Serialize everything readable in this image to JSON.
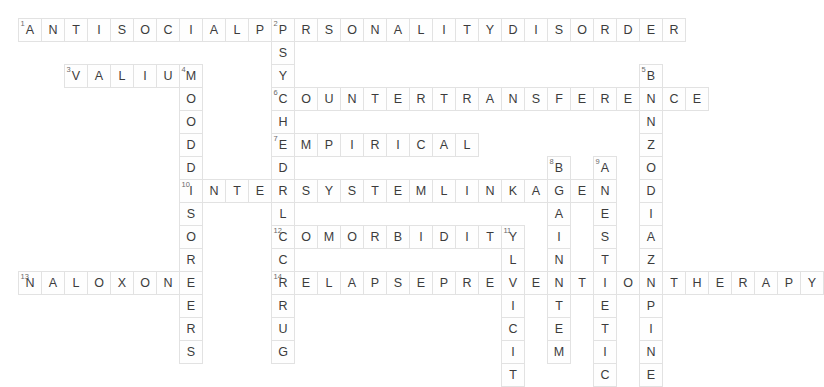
{
  "puzzle": {
    "title": "Psychiatry Crossword Grid",
    "grid": {
      "origin_x": 18,
      "origin_y": 18,
      "cell_size": 23,
      "cols": 29,
      "rows": 14
    },
    "colors": {
      "cell_fill": "#fefefe",
      "cell_border": "#e2e2e2",
      "letter": "#3c3c3c",
      "clue_number": "#6a6a6a",
      "background": "#ffffff"
    },
    "entries": [
      {
        "number": "1",
        "direction": "across",
        "answer": "ANTISOCIALPERSONALITYDISORDER",
        "row": 0,
        "col": 0
      },
      {
        "number": "2",
        "direction": "down",
        "answer": "PSYCHEDELICDRUG",
        "row": 0,
        "col": 11
      },
      {
        "number": "3",
        "direction": "across",
        "answer": "VALIUM",
        "row": 2,
        "col": 2
      },
      {
        "number": "4",
        "direction": "down",
        "answer": "MOODDISORDERS",
        "row": 2,
        "col": 7
      },
      {
        "number": "5",
        "direction": "down",
        "answer": "BENZODIAZEPINE",
        "row": 2,
        "col": 27
      },
      {
        "number": "6",
        "direction": "across",
        "answer": "COUNTERTRANSFERENCE",
        "row": 3,
        "col": 11
      },
      {
        "number": "7",
        "direction": "across",
        "answer": "EMPIRICAL",
        "row": 5,
        "col": 11
      },
      {
        "number": "8",
        "direction": "down",
        "answer": "BRAINSTEM",
        "row": 6,
        "col": 23
      },
      {
        "number": "9",
        "direction": "down",
        "answer": "ANESTHETIC",
        "row": 6,
        "col": 25
      },
      {
        "number": "10",
        "direction": "across",
        "answer": "INTERSYSTEMLINKAGE",
        "row": 7,
        "col": 7
      },
      {
        "number": "11",
        "direction": "down",
        "answer": "ILLICIT",
        "row": 9,
        "col": 21
      },
      {
        "number": "12",
        "direction": "across",
        "answer": "COMORBIDITY",
        "row": 9,
        "col": 11
      },
      {
        "number": "13",
        "direction": "across",
        "answer": "NALOXONE",
        "row": 11,
        "col": 0
      },
      {
        "number": "14",
        "direction": "across",
        "answer": "RELAPSEPREVENTIONTHERAPY",
        "row": 11,
        "col": 11
      }
    ]
  }
}
